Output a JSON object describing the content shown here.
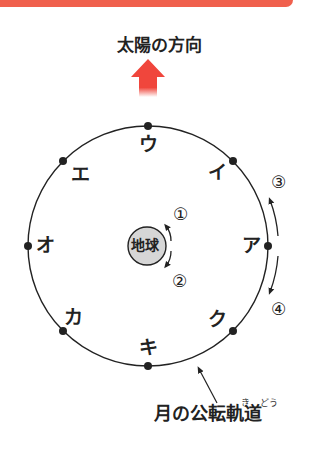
{
  "header": {
    "banner_color": "#f0604d",
    "title": "太陽の方向"
  },
  "sun_arrow": {
    "color": "#f0463c",
    "direction": "up"
  },
  "earth": {
    "label": "地球",
    "fill": "#d6d6d6"
  },
  "orbit": {
    "label": "月の公転軌道",
    "furigana": [
      {
        "base": "軌",
        "reading": "き"
      },
      {
        "base": "道",
        "reading": "どう"
      }
    ],
    "positions": [
      {
        "id": "ア",
        "label": "ア"
      },
      {
        "id": "イ",
        "label": "イ"
      },
      {
        "id": "ウ",
        "label": "ウ"
      },
      {
        "id": "エ",
        "label": "エ"
      },
      {
        "id": "オ",
        "label": "オ"
      },
      {
        "id": "カ",
        "label": "カ"
      },
      {
        "id": "キ",
        "label": "キ"
      },
      {
        "id": "ク",
        "label": "ク"
      }
    ]
  },
  "rotation_options": [
    {
      "id": "1",
      "label": "①",
      "meaning": "earth rotation arrow up"
    },
    {
      "id": "2",
      "label": "②",
      "meaning": "earth rotation arrow down"
    },
    {
      "id": "3",
      "label": "③",
      "meaning": "orbit arrow up"
    },
    {
      "id": "4",
      "label": "④",
      "meaning": "orbit arrow down"
    }
  ]
}
